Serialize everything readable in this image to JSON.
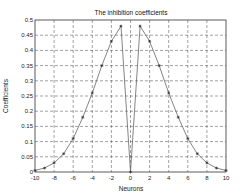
{
  "chart_data": {
    "type": "line",
    "title": "The inhibition coefficients",
    "xlabel": "Neurons",
    "ylabel": "Coefficients",
    "xlim": [
      -10,
      10
    ],
    "ylim": [
      0,
      0.5
    ],
    "grid": true,
    "xticks": [
      -10,
      -8,
      -6,
      -4,
      -2,
      0,
      2,
      4,
      6,
      8,
      10
    ],
    "yticks": [
      0,
      0.05,
      0.1,
      0.15,
      0.2,
      0.25,
      0.3,
      0.35,
      0.4,
      0.45,
      0.5
    ],
    "ytick_labels": [
      "0",
      "0.05",
      "0.1",
      "0.15",
      "0.2",
      "0.25",
      "0.3",
      "0.35",
      "0.4",
      "0.45",
      "0.5"
    ],
    "series": [
      {
        "name": "inhibition",
        "color": "#555555",
        "marker": "*",
        "x": [
          -10,
          -9,
          -8,
          -7,
          -6,
          -5,
          -4,
          -3,
          -2,
          -1,
          0,
          1,
          2,
          3,
          4,
          5,
          6,
          7,
          8,
          9,
          10
        ],
        "values": [
          0.005,
          0.013,
          0.03,
          0.06,
          0.11,
          0.18,
          0.26,
          0.35,
          0.43,
          0.48,
          0,
          0.48,
          0.43,
          0.35,
          0.26,
          0.18,
          0.11,
          0.06,
          0.03,
          0.013,
          0.005
        ]
      }
    ]
  }
}
